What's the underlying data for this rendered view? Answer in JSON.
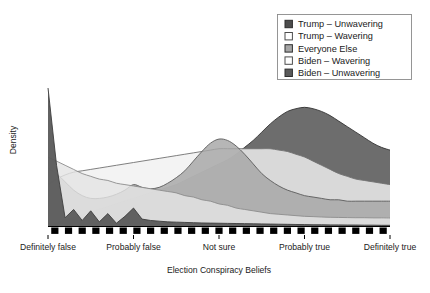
{
  "chart_data": {
    "type": "area",
    "title": "",
    "subtitle": "",
    "xlabel": "Election Conspiracy Beliefs",
    "ylabel": "Density",
    "grid": false,
    "legend_position": "top-right",
    "xlim": [
      1,
      5
    ],
    "ylim": [
      0,
      1
    ],
    "tick_labels": [
      "Definitely false",
      "Probably false",
      "Not sure",
      "Probably true",
      "Definitely true"
    ],
    "tick_values": [
      1,
      2,
      3,
      4,
      5
    ],
    "x": [
      1.0,
      1.1,
      1.2,
      1.3,
      1.4,
      1.5,
      1.6,
      1.7,
      1.8,
      1.9,
      2.0,
      2.1,
      2.2,
      2.3,
      2.4,
      2.5,
      2.6,
      2.7,
      2.8,
      2.9,
      3.0,
      3.1,
      3.2,
      3.3,
      3.4,
      3.5,
      3.6,
      3.7,
      3.8,
      3.9,
      4.0,
      4.1,
      4.2,
      4.3,
      4.4,
      4.5,
      4.6,
      4.7,
      4.8,
      4.9,
      5.0
    ],
    "series": [
      {
        "name": "Trump – Unwavering",
        "fill": "#4d4d4d",
        "stroke": "#333333",
        "values": [
          0.0,
          0.02,
          0.04,
          0.06,
          0.08,
          0.1,
          0.12,
          0.14,
          0.16,
          0.18,
          0.2,
          0.22,
          0.24,
          0.26,
          0.28,
          0.3,
          0.33,
          0.36,
          0.39,
          0.42,
          0.45,
          0.48,
          0.52,
          0.57,
          0.62,
          0.68,
          0.74,
          0.79,
          0.83,
          0.85,
          0.86,
          0.85,
          0.83,
          0.8,
          0.76,
          0.72,
          0.68,
          0.64,
          0.6,
          0.57,
          0.55
        ]
      },
      {
        "name": "Trump – Wavering",
        "fill": "#f0f0f0",
        "stroke": "#707070",
        "values": [
          0.3,
          0.34,
          0.37,
          0.39,
          0.4,
          0.41,
          0.42,
          0.43,
          0.44,
          0.45,
          0.46,
          0.47,
          0.48,
          0.49,
          0.5,
          0.51,
          0.52,
          0.53,
          0.54,
          0.55,
          0.56,
          0.56,
          0.56,
          0.56,
          0.56,
          0.56,
          0.56,
          0.55,
          0.54,
          0.52,
          0.5,
          0.47,
          0.44,
          0.41,
          0.38,
          0.36,
          0.34,
          0.33,
          0.32,
          0.31,
          0.3
        ]
      },
      {
        "name": "Everyone Else",
        "fill": "#a6a6a6",
        "stroke": "#5a5a5a",
        "values": [
          0.42,
          0.38,
          0.32,
          0.26,
          0.22,
          0.2,
          0.2,
          0.21,
          0.23,
          0.26,
          0.3,
          0.28,
          0.27,
          0.28,
          0.31,
          0.35,
          0.4,
          0.47,
          0.54,
          0.6,
          0.63,
          0.62,
          0.58,
          0.52,
          0.45,
          0.38,
          0.33,
          0.29,
          0.26,
          0.24,
          0.22,
          0.21,
          0.2,
          0.19,
          0.19,
          0.18,
          0.18,
          0.18,
          0.18,
          0.18,
          0.18
        ]
      },
      {
        "name": "Biden – Wavering",
        "fill": "#e4e4e4",
        "stroke": "#8c8c8c",
        "values": [
          0.5,
          0.47,
          0.44,
          0.41,
          0.38,
          0.36,
          0.34,
          0.33,
          0.31,
          0.3,
          0.29,
          0.28,
          0.27,
          0.26,
          0.25,
          0.24,
          0.22,
          0.21,
          0.19,
          0.18,
          0.16,
          0.15,
          0.13,
          0.12,
          0.11,
          0.1,
          0.09,
          0.085,
          0.08,
          0.075,
          0.07,
          0.068,
          0.065,
          0.063,
          0.062,
          0.061,
          0.06,
          0.06,
          0.059,
          0.059,
          0.058
        ]
      },
      {
        "name": "Biden – Unwavering",
        "fill": "#5a5a5a",
        "stroke": "#3d3d3d",
        "values": [
          1.0,
          0.44,
          0.06,
          0.12,
          0.04,
          0.11,
          0.03,
          0.09,
          0.02,
          0.07,
          0.13,
          0.05,
          0.04,
          0.035,
          0.03,
          0.028,
          0.026,
          0.024,
          0.022,
          0.021,
          0.02,
          0.019,
          0.018,
          0.017,
          0.016,
          0.015,
          0.014,
          0.013,
          0.012,
          0.011,
          0.01,
          0.009,
          0.009,
          0.008,
          0.008,
          0.007,
          0.007,
          0.006,
          0.006,
          0.005,
          0.005
        ]
      }
    ],
    "rug": {
      "count": 25,
      "color": "#000000",
      "marker": "square"
    }
  },
  "legend": {
    "items": [
      {
        "label": "Trump – Unwavering",
        "swatch": "#4d4d4d",
        "filled": true
      },
      {
        "label": "Trump – Wavering",
        "swatch": "#ffffff",
        "filled": false
      },
      {
        "label": "Everyone Else",
        "swatch": "#a6a6a6",
        "filled": true
      },
      {
        "label": "Biden – Wavering",
        "swatch": "#ffffff",
        "filled": false
      },
      {
        "label": "Biden – Unwavering",
        "swatch": "#5a5a5a",
        "filled": true
      }
    ]
  }
}
